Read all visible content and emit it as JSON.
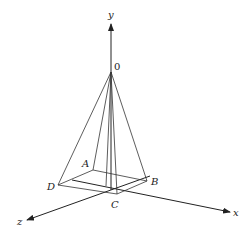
{
  "diagram": {
    "axes": [
      {
        "name": "x",
        "label": "x"
      },
      {
        "name": "y",
        "label": "y"
      },
      {
        "name": "z",
        "label": "z"
      }
    ],
    "apex": {
      "label": "0"
    },
    "base_vertices": [
      {
        "id": "A",
        "label": "A"
      },
      {
        "id": "B",
        "label": "B"
      },
      {
        "id": "C",
        "label": "C"
      },
      {
        "id": "D",
        "label": "D"
      }
    ],
    "colors": {
      "stroke": "#333333",
      "background": "#ffffff"
    }
  }
}
